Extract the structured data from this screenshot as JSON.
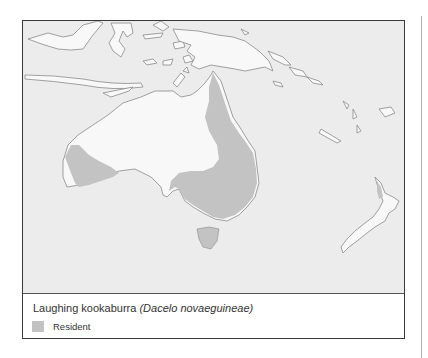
{
  "map": {
    "title": "Laughing kookaburra",
    "scientific_name": "(Dacelo novaeguineae)",
    "region": "Australia and Oceania",
    "colors": {
      "ocean": "#ececec",
      "land": "#f8f8f8",
      "coastline": "#8a8a8a",
      "resident_range": "#c3c3c3",
      "frame": "#3a3a3a"
    }
  },
  "legend": {
    "items": [
      {
        "label": "Resident",
        "color": "#c3c3c3"
      }
    ]
  }
}
